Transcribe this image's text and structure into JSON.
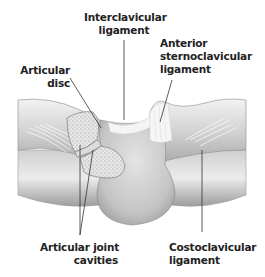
{
  "diagram": {
    "labels": {
      "interclavicular": [
        "Interclavicular",
        "ligament"
      ],
      "anterior": [
        "Anterior",
        "sternoclavicular",
        "ligament"
      ],
      "articular_disc": [
        "Articular",
        "disc"
      ],
      "joint_cavities": [
        "Articular joint",
        "cavities"
      ],
      "costoclavicular": [
        "Costoclavicular",
        "ligament"
      ]
    },
    "colors": {
      "bone_light": "#e8e8e8",
      "bone_mid": "#bdbdbd",
      "bone_dark": "#8a8a8a",
      "ligament": "#f4f4f4",
      "leader_line": "#333333",
      "text": "#222222"
    }
  }
}
